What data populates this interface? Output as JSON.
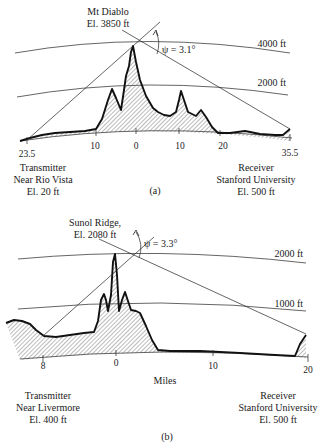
{
  "panel_a": {
    "peak_label_line1": "Mt Diablo",
    "peak_label_line2": "El. 3850 ft",
    "angle_label": "ψ = 3.1°",
    "contours": [
      "4000 ft",
      "2000 ft"
    ],
    "ticks": [
      "10",
      "0",
      "10",
      "20"
    ],
    "left_end": "23.5",
    "right_end": "35.5",
    "transmitter": [
      "Transmitter",
      "Near Rio Vista",
      "El. 20 ft"
    ],
    "receiver": [
      "Receiver",
      "Stanford University",
      "El. 500 ft"
    ],
    "caption": "(a)"
  },
  "panel_b": {
    "peak_label_line1": "Sunol Ridge,",
    "peak_label_line2": "El. 2080 ft",
    "angle_label": "ψ = 3.3°",
    "contours": [
      "2000 ft",
      "1000 ft"
    ],
    "ticks": [
      "8",
      "0",
      "10",
      "20"
    ],
    "axis_label": "Miles",
    "transmitter": [
      "Transmitter",
      "Near Livermore",
      "El. 400 ft"
    ],
    "receiver": [
      "Receiver",
      "Stanford University",
      "El. 500 ft"
    ],
    "caption": "(b)"
  }
}
